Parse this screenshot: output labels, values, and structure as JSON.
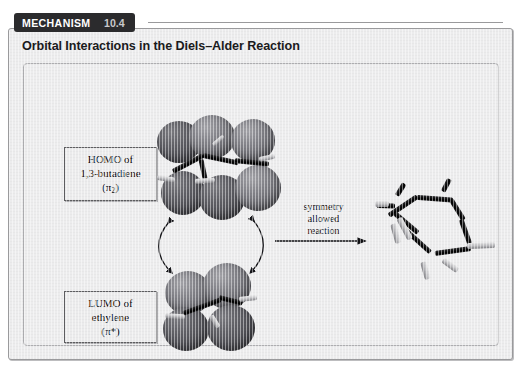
{
  "badge": {
    "label": "MECHANISM",
    "number": "10.4"
  },
  "figure": {
    "title": "Orbital Interactions in the Diels–Alder Reaction"
  },
  "captions": {
    "homo": {
      "line1": "HOMO of",
      "line2": "1,3-butadiene",
      "line3_prefix": "(π",
      "line3_sub": "2",
      "line3_suffix": ")"
    },
    "lumo": {
      "line1": "LUMO of",
      "line2": "ethylene",
      "line3": "(π*)"
    }
  },
  "reaction": {
    "label_line1": "symmetry",
    "label_line2": "allowed",
    "label_line3": "reaction"
  },
  "models": {
    "butadiene_homo": "1,3-butadiene HOMO pi-2 orbital model",
    "ethylene_lumo": "ethylene LUMO pi-star orbital model",
    "product": "cyclohexene ball-and-stick product model"
  },
  "colors": {
    "badge_background": "#2b2b2d",
    "badge_text": "#ffffff",
    "panel_background": "#ececed",
    "panel_border": "#9a9a9c",
    "caption_border": "#5d5d60",
    "orbital_lobe": "#58585d",
    "carbon_bond": "#000000",
    "hydrogen_bond": "#c2c2c5"
  }
}
